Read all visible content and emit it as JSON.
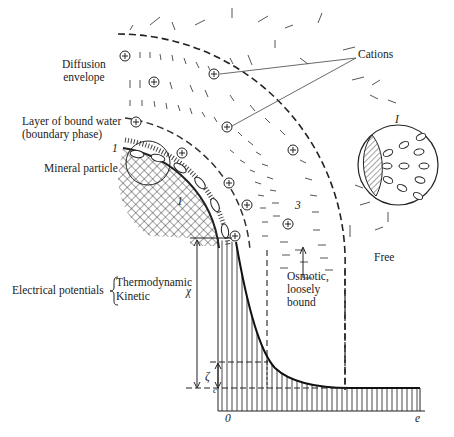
{
  "figure": {
    "type": "double electrical layer around a mineral particle",
    "labels": {
      "diffusion_envelope": [
        "Diffusion",
        "envelope"
      ],
      "bound_water": [
        "Layer of bound water",
        "(boundary phase)"
      ],
      "mineral_particle": "Mineral particle",
      "cations": "Cations",
      "osmotic": [
        "Osmotic,",
        "loosely",
        "bound"
      ],
      "free": "Free",
      "electrical_potentials": "Electrical potentials",
      "thermodynamic": "Thermodynamic",
      "kinetic": "Kinetic",
      "chi": "χ",
      "zeta": "ζ",
      "zone_1": "1",
      "zone_2": "1",
      "zone_3": "3",
      "inset_1": "I",
      "axis_c": "c",
      "axis_origin": "0",
      "axis_end": "e"
    },
    "symbols": {
      "cation": "⊕"
    },
    "colors": {
      "ink": "#222222",
      "background": "#ffffff"
    }
  }
}
